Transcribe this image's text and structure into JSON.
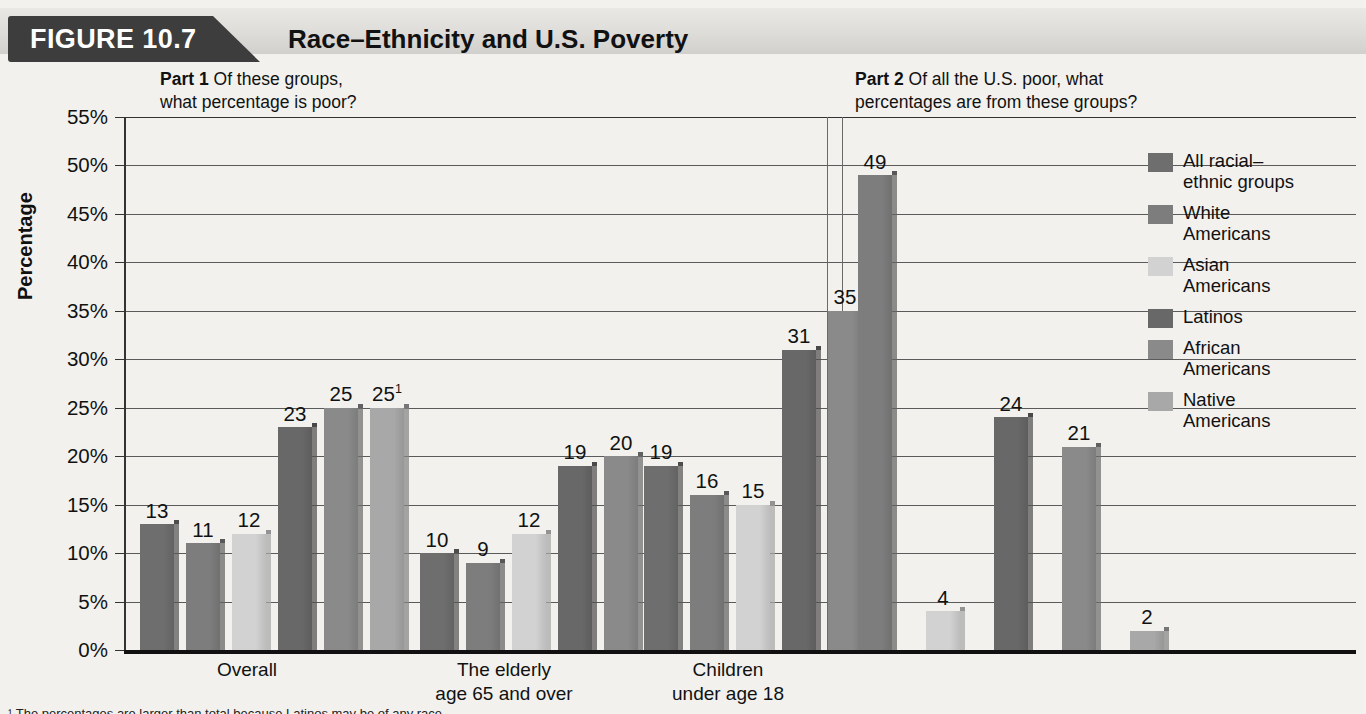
{
  "header": {
    "figure_tab": "FIGURE 10.7",
    "title": "Race–Ethnicity and U.S. Poverty"
  },
  "part1": {
    "label": "Part 1",
    "question_line1": "Of these groups,",
    "question_line2": "what percentage is poor?"
  },
  "part2": {
    "label": "Part 2",
    "question_line1": "Of all the U.S. poor, what",
    "question_line2": "percentages are from these groups?"
  },
  "footnote": "¹ The percentages are larger than total because Latinos may be of any race.",
  "legend": {
    "items": [
      {
        "label_line1": "All racial–",
        "label_line2": "ethnic groups",
        "color": "#6e6e6e"
      },
      {
        "label_line1": "White",
        "label_line2": "Americans",
        "color": "#7d7d7d"
      },
      {
        "label_line1": "Asian",
        "label_line2": "Americans",
        "color": "#d2d2d2"
      },
      {
        "label_line1": "Latinos",
        "label_line2": "",
        "color": "#686868"
      },
      {
        "label_line1": "African",
        "label_line2": "Americans",
        "color": "#8a8a8a"
      },
      {
        "label_line1": "Native",
        "label_line2": "Americans",
        "color": "#a8a8a8"
      }
    ]
  },
  "chart_data": {
    "type": "bar",
    "title": "Race–Ethnicity and U.S. Poverty",
    "ylabel": "Percentage",
    "xlabel": "",
    "ylim": [
      0,
      55
    ],
    "yticks": [
      0,
      5,
      10,
      15,
      20,
      25,
      30,
      35,
      40,
      45,
      50,
      55
    ],
    "ytick_labels": [
      "0%",
      "5%",
      "10%",
      "15%",
      "20%",
      "25%",
      "30%",
      "35%",
      "40%",
      "45%",
      "50%",
      "55%"
    ],
    "grid": true,
    "legend_position": "right",
    "series": [
      {
        "name": "All racial–ethnic groups",
        "color": "#6e6e6e"
      },
      {
        "name": "White Americans",
        "color": "#7d7d7d"
      },
      {
        "name": "Asian Americans",
        "color": "#d2d2d2"
      },
      {
        "name": "Latinos",
        "color": "#686868"
      },
      {
        "name": "African Americans",
        "color": "#8a8a8a"
      },
      {
        "name": "Native Americans",
        "color": "#a8a8a8"
      }
    ],
    "groups": [
      {
        "part": 1,
        "category_line1": "Overall",
        "category_line2": "",
        "bars": [
          {
            "series": "All racial–ethnic groups",
            "value": 13,
            "label": "13"
          },
          {
            "series": "White Americans",
            "value": 11,
            "label": "11"
          },
          {
            "series": "Asian Americans",
            "value": 12,
            "label": "12"
          },
          {
            "series": "Latinos",
            "value": 23,
            "label": "23"
          },
          {
            "series": "African Americans",
            "value": 25,
            "label": "25"
          },
          {
            "series": "Native Americans",
            "value": 25,
            "label": "25",
            "footnote_marker": "1"
          }
        ]
      },
      {
        "part": 1,
        "category_line1": "The elderly",
        "category_line2": "age 65 and over",
        "bars": [
          {
            "series": "All racial–ethnic groups",
            "value": 10,
            "label": "10"
          },
          {
            "series": "White Americans",
            "value": 9,
            "label": "9"
          },
          {
            "series": "Asian Americans",
            "value": 12,
            "label": "12"
          },
          {
            "series": "Latinos",
            "value": 19,
            "label": "19"
          },
          {
            "series": "African Americans",
            "value": 20,
            "label": "20"
          }
        ]
      },
      {
        "part": 1,
        "category_line1": "Children",
        "category_line2": "under age 18",
        "bars": [
          {
            "series": "All racial–ethnic groups",
            "value": 19,
            "label": "19"
          },
          {
            "series": "White Americans",
            "value": 16,
            "label": "16"
          },
          {
            "series": "Asian Americans",
            "value": 15,
            "label": "15"
          },
          {
            "series": "Latinos",
            "value": 31,
            "label": "31"
          },
          {
            "series": "African Americans",
            "value": 35,
            "label": "35"
          }
        ]
      },
      {
        "part": 2,
        "category_line1": "",
        "category_line2": "",
        "bars": [
          {
            "series": "White Americans",
            "value": 49,
            "label": "49"
          },
          {
            "series": "Asian Americans",
            "value": 4,
            "label": "4"
          },
          {
            "series": "Latinos",
            "value": 24,
            "label": "24"
          },
          {
            "series": "African Americans",
            "value": 21,
            "label": "21"
          },
          {
            "series": "Native Americans",
            "value": 2,
            "label": "2"
          }
        ]
      }
    ]
  }
}
